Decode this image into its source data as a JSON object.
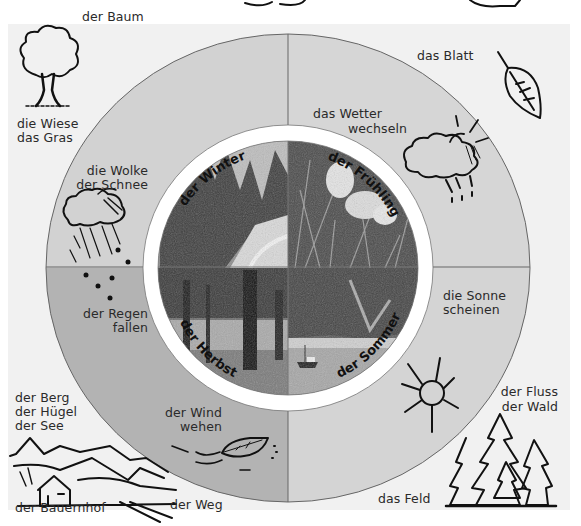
{
  "diagram": {
    "type": "seasons-vocabulary-wheel",
    "colors": {
      "page_background": "#ffffff",
      "panel_background": "#f1f1f1",
      "quadrant_winter": "#d2d2d2",
      "quadrant_spring": "#d6d6d6",
      "quadrant_summer": "#d4d4d4",
      "quadrant_autumn": "#b3b3b3",
      "ring": "#ffffff",
      "line": "#555555",
      "ink": "#111111"
    },
    "seasons": [
      {
        "id": "winter",
        "label": "der Winter",
        "photo": "snowy-forest-path"
      },
      {
        "id": "spring",
        "label": "der Frühling",
        "photo": "crocus-flowers-in-grass"
      },
      {
        "id": "summer",
        "label": "der Sommer",
        "photo": "lake-with-boat"
      },
      {
        "id": "autumn",
        "label": "der Herbst",
        "photo": "trees-in-park"
      }
    ],
    "ring_vocabulary": {
      "winter": [
        "die Wolke",
        "der Schnee"
      ],
      "spring": [
        "das Wetter",
        "wechseln"
      ],
      "summer": [
        "die Sonne",
        "scheinen"
      ],
      "autumn_rain": [
        "der Regen",
        "fallen"
      ],
      "autumn_wind": [
        "der Wind",
        "wehen"
      ]
    },
    "corner_vocabulary": {
      "top_left": [
        "der Baum"
      ],
      "top_left_below": [
        "die Wiese",
        "das Gras"
      ],
      "top_right": [
        "das Blatt"
      ],
      "bottom_left": [
        "der Berg",
        "der Hügel",
        "der See"
      ],
      "bottom_left_farm": [
        "der Bauernhof"
      ],
      "bottom_path": [
        "der Weg"
      ],
      "bottom_right_field": [
        "das Feld"
      ],
      "bottom_right": [
        "der Fluss",
        "der Wald"
      ]
    },
    "icons": [
      "tree-icon",
      "leaf-icon",
      "sun-cloud-rain-icon",
      "snow-cloud-icon",
      "sun-icon",
      "wind-leaf-icon",
      "landscape-farm-icon",
      "forest-icon"
    ]
  }
}
